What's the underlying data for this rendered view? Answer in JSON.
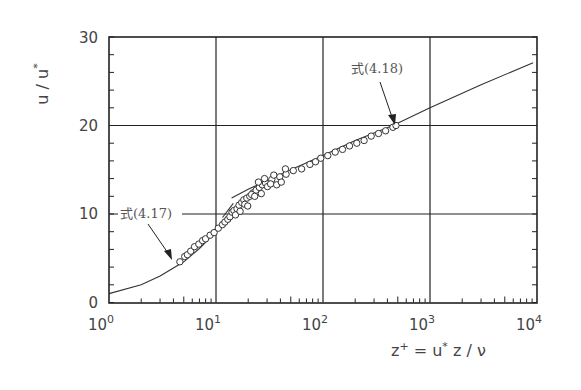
{
  "chart_data": {
    "type": "scatter",
    "title": "",
    "xlabel": "z⁺ = u* z / ν",
    "ylabel": "u / u*",
    "xscale": "log",
    "xlim": [
      1,
      10000
    ],
    "ylim": [
      0,
      30
    ],
    "x_ticks": [
      {
        "value": 1,
        "base": "10",
        "exp": "0"
      },
      {
        "value": 10,
        "base": "10",
        "exp": "1"
      },
      {
        "value": 100,
        "base": "10",
        "exp": "2"
      },
      {
        "value": 1000,
        "base": "10",
        "exp": "3"
      },
      {
        "value": 10000,
        "base": "10",
        "exp": "4"
      }
    ],
    "y_ticks": [
      0,
      10,
      20,
      30
    ],
    "y_minor_step": 2,
    "grid": {
      "x_major": [
        10,
        100,
        1000
      ],
      "y_major": [
        10,
        20
      ]
    },
    "legend": null,
    "series": [
      {
        "name": "式(4.17) viscous sublayer / buffer curve",
        "type": "line",
        "points": [
          [
            1,
            1.0
          ],
          [
            2,
            2.0
          ],
          [
            3,
            3.0
          ],
          [
            4,
            3.9
          ],
          [
            5,
            4.6
          ],
          [
            6,
            5.4
          ],
          [
            7,
            6.1
          ],
          [
            8,
            6.8
          ],
          [
            10,
            8.1
          ],
          [
            12,
            9.1
          ],
          [
            14,
            9.9
          ]
        ]
      },
      {
        "name": "log-law stub near z+=10",
        "type": "line",
        "points": [
          [
            11.5,
            9.6
          ],
          [
            14.5,
            11.2
          ]
        ]
      },
      {
        "name": "式(4.18) log law",
        "type": "line",
        "points": [
          [
            14,
            11.8
          ],
          [
            20,
            12.8
          ],
          [
            50,
            15.0
          ],
          [
            100,
            16.6
          ],
          [
            200,
            18.3
          ],
          [
            450,
            20.0
          ],
          [
            1000,
            22.0
          ],
          [
            3000,
            24.6
          ],
          [
            9200,
            27.1
          ]
        ]
      },
      {
        "name": "measured data",
        "type": "scatter",
        "marker": "open-circle",
        "points": [
          [
            4.6,
            4.6
          ],
          [
            5.1,
            5.2
          ],
          [
            5.4,
            5.4
          ],
          [
            5.8,
            5.8
          ],
          [
            6.3,
            6.3
          ],
          [
            6.9,
            6.6
          ],
          [
            7.5,
            7.0
          ],
          [
            8.0,
            7.2
          ],
          [
            8.8,
            7.6
          ],
          [
            9.6,
            7.9
          ],
          [
            10.5,
            8.4
          ],
          [
            11.5,
            8.8
          ],
          [
            12.1,
            9.1
          ],
          [
            12.9,
            9.4
          ],
          [
            13.5,
            9.7
          ],
          [
            14.1,
            10.2
          ],
          [
            14.7,
            10.4
          ],
          [
            15.7,
            10.6
          ],
          [
            16.4,
            11.0
          ],
          [
            17.4,
            11.3
          ],
          [
            18.2,
            11.6
          ],
          [
            19.4,
            11.8
          ],
          [
            20.7,
            12.0
          ],
          [
            22.2,
            12.4
          ],
          [
            23.7,
            12.7
          ],
          [
            25.4,
            13.0
          ],
          [
            27.1,
            13.3
          ],
          [
            29.0,
            13.5
          ],
          [
            33.2,
            13.9
          ],
          [
            39.5,
            14.2
          ],
          [
            45.2,
            14.5
          ],
          [
            52.8,
            14.9
          ],
          [
            63.1,
            15.1
          ],
          [
            75.4,
            15.6
          ],
          [
            85.1,
            15.9
          ],
          [
            95.3,
            16.3
          ],
          [
            111,
            16.6
          ],
          [
            130,
            17.0
          ],
          [
            152,
            17.3
          ],
          [
            177,
            17.7
          ],
          [
            207,
            18.0
          ],
          [
            242,
            18.3
          ],
          [
            282,
            18.8
          ],
          [
            330,
            19.1
          ],
          [
            385,
            19.4
          ],
          [
            450,
            19.8
          ],
          [
            481,
            20.0
          ],
          [
            15.2,
            9.9
          ],
          [
            16.8,
            10.3
          ],
          [
            18.6,
            11.1
          ],
          [
            19.8,
            10.9
          ],
          [
            21.5,
            12.2
          ],
          [
            23.0,
            12.0
          ],
          [
            24.9,
            13.6
          ],
          [
            26.5,
            12.3
          ],
          [
            28.4,
            14.0
          ],
          [
            30.3,
            13.1
          ],
          [
            32.4,
            13.4
          ],
          [
            34.7,
            14.4
          ],
          [
            36.9,
            13.3
          ],
          [
            40.8,
            13.6
          ],
          [
            44.5,
            15.1
          ]
        ]
      }
    ],
    "annotations": [
      {
        "text": "式(4.17)",
        "x_px": 120,
        "y_px": 218,
        "arrow_to_px": [
          172,
          259
        ]
      },
      {
        "text": "式(4.18)",
        "x_px": 351,
        "y_px": 73,
        "arrow_to_px": [
          395,
          124
        ]
      }
    ]
  },
  "labels": {
    "ylabel_main": "u / u",
    "ylabel_sup": "*",
    "xlabel_main": "z",
    "xlabel_sup": "+",
    "xlabel_rest": " = u",
    "xlabel_sup2": "*",
    "xlabel_tail": " z / ν",
    "y_tick_labels": [
      "0",
      "10",
      "20",
      "30"
    ],
    "anno_417": "式(4.17)",
    "anno_418": "式(4.18)"
  }
}
